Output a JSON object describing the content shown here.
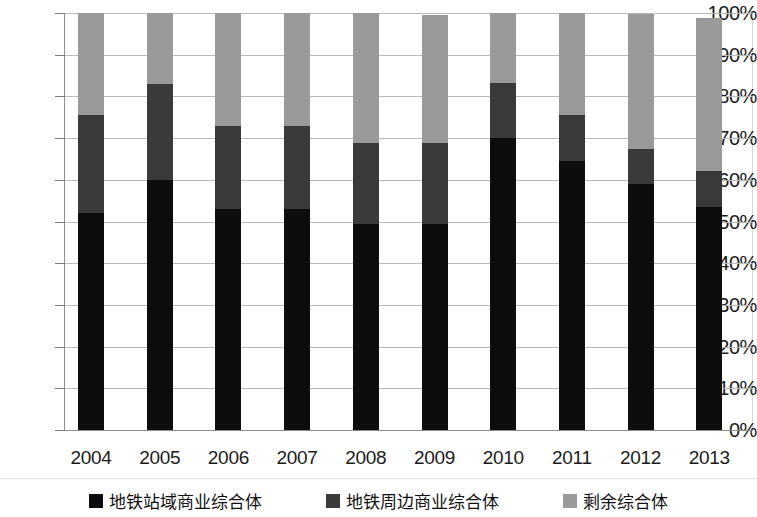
{
  "chart_data": {
    "type": "bar",
    "stacked": true,
    "stacked_mode": "percent",
    "title": "",
    "subtitle": "",
    "xlabel": "",
    "ylabel": "",
    "grid": true,
    "legend_position": "bottom",
    "ylim": [
      0,
      100
    ],
    "yticks": [
      "0%",
      "10%",
      "20%",
      "30%",
      "40%",
      "50%",
      "60%",
      "70%",
      "80%",
      "90%",
      "100%"
    ],
    "ytick_values": [
      0,
      10,
      20,
      30,
      40,
      50,
      60,
      70,
      80,
      90,
      100
    ],
    "categories": [
      "2004",
      "2005",
      "2006",
      "2007",
      "2008",
      "2009",
      "2010",
      "2011",
      "2012",
      "2013"
    ],
    "series": [
      {
        "name": "地铁站域商业综合体",
        "color": "#0d0d0d",
        "values": [
          52.0,
          60.0,
          53.0,
          53.0,
          49.5,
          49.5,
          70.0,
          64.5,
          59.0,
          53.5
        ]
      },
      {
        "name": "地铁周边商业综合体",
        "color": "#3a3a3a",
        "values": [
          23.5,
          23.0,
          19.8,
          19.8,
          19.3,
          19.3,
          13.3,
          11.0,
          8.5,
          8.5
        ]
      },
      {
        "name": "剩余综合体",
        "color": "#9a9a9a",
        "values": [
          24.5,
          17.0,
          27.2,
          27.2,
          31.2,
          30.8,
          16.7,
          24.5,
          32.2,
          36.7
        ]
      }
    ],
    "segment_tops": {
      "2004": [
        52.0,
        75.5,
        100.0
      ],
      "2005": [
        60.0,
        83.0,
        100.0
      ],
      "2006": [
        53.0,
        72.8,
        100.0
      ],
      "2007": [
        53.0,
        72.8,
        100.0
      ],
      "2008": [
        49.5,
        68.8,
        100.0
      ],
      "2009": [
        49.5,
        68.8,
        99.6
      ],
      "2010": [
        70.0,
        83.3,
        100.0
      ],
      "2011": [
        64.5,
        75.5,
        100.0
      ],
      "2012": [
        59.0,
        67.5,
        99.7
      ],
      "2013": [
        53.5,
        62.0,
        98.7
      ]
    }
  },
  "legend": {
    "items": [
      {
        "label": "地铁站域商业综合体",
        "color": "#0d0d0d",
        "swatch_name": "legend-swatch-station-complex"
      },
      {
        "label": "地铁周边商业综合体",
        "color": "#3a3a3a",
        "swatch_name": "legend-swatch-surrounding-complex"
      },
      {
        "label": "剩余综合体",
        "color": "#9a9a9a",
        "swatch_name": "legend-swatch-remaining-complex"
      }
    ]
  }
}
